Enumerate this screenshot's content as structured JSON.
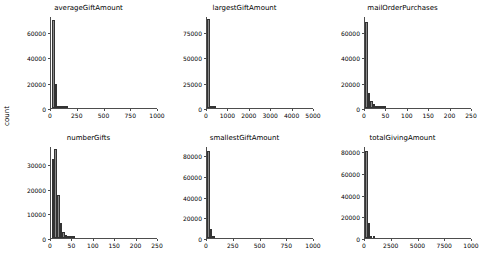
{
  "figure": {
    "ylabel": "count",
    "bar_color": "#8a8a8a",
    "bar_edge_color": "#333333",
    "axis_color": "#4d4d4d",
    "background": "#ffffff"
  },
  "chart_data": [
    {
      "type": "bar",
      "title": "averageGiftAmount",
      "xlabel": "",
      "ylabel": "count",
      "xlim": [
        0,
        1000
      ],
      "ylim": [
        0,
        72000
      ],
      "xticks": [
        0,
        250,
        500,
        750,
        1000
      ],
      "xticklabels": [
        "0",
        "250",
        "500",
        "750",
        "1000"
      ],
      "yticks": [
        0,
        20000,
        40000,
        60000
      ],
      "yticklabels": [
        "0",
        "20000",
        "40000",
        "60000"
      ],
      "grid": false,
      "bin_width": 25,
      "bin_starts": [
        10,
        35,
        60,
        85,
        110,
        135
      ],
      "values": [
        70000,
        19000,
        900,
        250,
        120,
        60
      ]
    },
    {
      "type": "bar",
      "title": "largestGiftAmount",
      "xlabel": "",
      "ylabel": "count",
      "xlim": [
        0,
        5000
      ],
      "ylim": [
        0,
        90000
      ],
      "xticks": [
        0,
        1000,
        2000,
        3000,
        4000,
        5000
      ],
      "xticklabels": [
        "0",
        "1000",
        "2000",
        "3000",
        "4000",
        "5000"
      ],
      "yticks": [
        0,
        25000,
        50000,
        75000
      ],
      "yticklabels": [
        "0",
        "25000",
        "50000",
        "75000"
      ],
      "grid": false,
      "bin_width": 100,
      "bin_starts": [
        20,
        120,
        220,
        320
      ],
      "values": [
        88000,
        1800,
        400,
        120
      ]
    },
    {
      "type": "bar",
      "title": "mailOrderPurchases",
      "xlabel": "",
      "ylabel": "count",
      "xlim": [
        0,
        250
      ],
      "ylim": [
        0,
        72000
      ],
      "xticks": [
        0,
        50,
        100,
        150,
        200,
        250
      ],
      "xticklabels": [
        "0",
        "50",
        "100",
        "150",
        "200",
        "250"
      ],
      "yticks": [
        0,
        20000,
        40000,
        60000
      ],
      "yticklabels": [
        "0",
        "20000",
        "40000",
        "60000"
      ],
      "grid": false,
      "bin_width": 6,
      "bin_starts": [
        0,
        6,
        12,
        18,
        24,
        30,
        36,
        42
      ],
      "values": [
        68000,
        12000,
        5200,
        3000,
        1200,
        500,
        250,
        120
      ]
    },
    {
      "type": "bar",
      "title": "numberGifts",
      "xlabel": "",
      "ylabel": "count",
      "xlim": [
        0,
        250
      ],
      "ylim": [
        0,
        37000
      ],
      "xticks": [
        0,
        50,
        100,
        150,
        200,
        250
      ],
      "xticklabels": [
        "0",
        "50",
        "100",
        "150",
        "200",
        "250"
      ],
      "yticks": [
        0,
        10000,
        20000,
        30000
      ],
      "yticklabels": [
        "0",
        "10000",
        "20000",
        "30000"
      ],
      "grid": false,
      "bin_width": 6,
      "bin_starts": [
        2,
        8,
        14,
        20,
        26,
        32,
        38,
        44,
        50
      ],
      "values": [
        32000,
        36000,
        17500,
        6000,
        2500,
        1100,
        500,
        220,
        90
      ]
    },
    {
      "type": "bar",
      "title": "smallestGiftAmount",
      "xlabel": "",
      "ylabel": "count",
      "xlim": [
        0,
        1000
      ],
      "ylim": [
        0,
        88000
      ],
      "xticks": [
        0,
        250,
        500,
        750,
        1000
      ],
      "xticklabels": [
        "0",
        "250",
        "500",
        "750",
        "1000"
      ],
      "yticks": [
        0,
        20000,
        40000,
        60000,
        80000
      ],
      "yticklabels": [
        "0",
        "20000",
        "40000",
        "60000",
        "80000"
      ],
      "grid": false,
      "bin_width": 22,
      "bin_starts": [
        2,
        26,
        50
      ],
      "values": [
        84000,
        9000,
        600
      ]
    },
    {
      "type": "bar",
      "title": "totalGivingAmount",
      "xlabel": "",
      "ylabel": "count",
      "xlim": [
        0,
        10000
      ],
      "ylim": [
        0,
        84000
      ],
      "xticks": [
        0,
        2500,
        5000,
        7500,
        10000
      ],
      "xticklabels": [
        "0",
        "2500",
        "5000",
        "7500",
        "1000"
      ],
      "yticks": [
        0,
        20000,
        40000,
        60000,
        80000
      ],
      "yticklabels": [
        "0",
        "20000",
        "40000",
        "60000",
        "80000"
      ],
      "grid": false,
      "bin_width": 220,
      "bin_starts": [
        20,
        250,
        480,
        710
      ],
      "values": [
        80000,
        14000,
        2000,
        600
      ]
    }
  ]
}
